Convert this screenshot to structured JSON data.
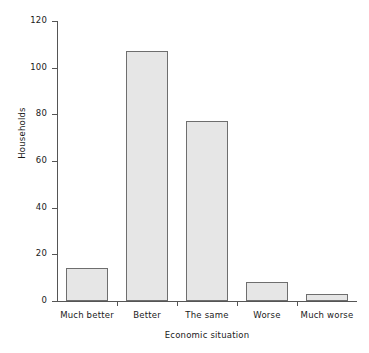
{
  "chart_data": {
    "type": "bar",
    "title": "",
    "xlabel": "Economic situation",
    "ylabel": "Households",
    "categories": [
      "Much better",
      "Better",
      "The same",
      "Worse",
      "Much worse"
    ],
    "values": [
      14,
      107,
      77,
      8,
      3
    ],
    "ylim": [
      0,
      120
    ],
    "yticks": [
      0,
      20,
      40,
      60,
      80,
      100,
      120
    ],
    "ytick_labels": [
      "0",
      "20",
      "40",
      "60",
      "80",
      "100",
      "120"
    ],
    "grid": false,
    "legend": false,
    "bar_fill_color": "#e6e6e6",
    "bar_edge_color": "#6e6e6e",
    "axis_color": "#555555"
  }
}
